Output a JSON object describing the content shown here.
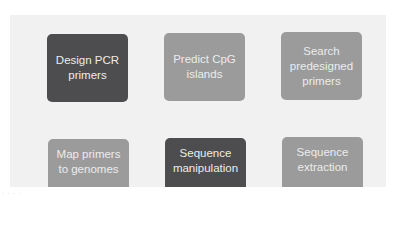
{
  "tools": [
    {
      "label": "Design PCR primers",
      "style": "dark"
    },
    {
      "label": "Predict CpG islands",
      "style": "light"
    },
    {
      "label": "Search predesigned primers",
      "style": "light"
    },
    {
      "label": "Map primers to genomes",
      "style": "light"
    },
    {
      "label": "Sequence manipulation",
      "style": "dark"
    },
    {
      "label": "Sequence extraction",
      "style": "light"
    }
  ],
  "colors": {
    "dark_card": "#4d4d4f",
    "light_card": "#9b9b9b",
    "panel": "#f1f1f1",
    "text": "#ececec"
  },
  "footer": {
    "text": "· · · ·"
  }
}
